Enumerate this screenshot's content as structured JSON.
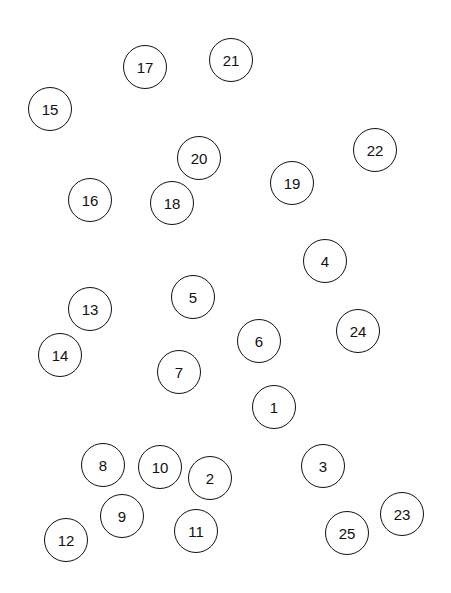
{
  "canvas": {
    "width": 451,
    "height": 593,
    "background": "#ffffff",
    "stroke_color": "#111111"
  },
  "nodes": [
    {
      "label": "1",
      "x": 274,
      "y": 407
    },
    {
      "label": "2",
      "x": 210,
      "y": 478
    },
    {
      "label": "3",
      "x": 323,
      "y": 466
    },
    {
      "label": "4",
      "x": 325,
      "y": 261
    },
    {
      "label": "5",
      "x": 193,
      "y": 297
    },
    {
      "label": "6",
      "x": 259,
      "y": 341
    },
    {
      "label": "7",
      "x": 179,
      "y": 372
    },
    {
      "label": "8",
      "x": 103,
      "y": 465
    },
    {
      "label": "9",
      "x": 122,
      "y": 516
    },
    {
      "label": "10",
      "x": 160,
      "y": 467
    },
    {
      "label": "11",
      "x": 196,
      "y": 531
    },
    {
      "label": "12",
      "x": 66,
      "y": 540
    },
    {
      "label": "13",
      "x": 90,
      "y": 309
    },
    {
      "label": "14",
      "x": 60,
      "y": 355
    },
    {
      "label": "15",
      "x": 50,
      "y": 109
    },
    {
      "label": "16",
      "x": 90,
      "y": 200
    },
    {
      "label": "17",
      "x": 145,
      "y": 67
    },
    {
      "label": "18",
      "x": 172,
      "y": 203
    },
    {
      "label": "19",
      "x": 292,
      "y": 183
    },
    {
      "label": "20",
      "x": 199,
      "y": 158
    },
    {
      "label": "21",
      "x": 231,
      "y": 60
    },
    {
      "label": "22",
      "x": 375,
      "y": 150
    },
    {
      "label": "23",
      "x": 402,
      "y": 514
    },
    {
      "label": "24",
      "x": 358,
      "y": 331
    },
    {
      "label": "25",
      "x": 347,
      "y": 533
    }
  ]
}
